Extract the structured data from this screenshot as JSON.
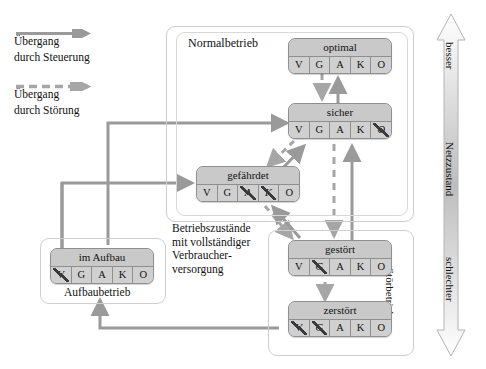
{
  "legend": {
    "items": [
      {
        "arrow": "solid-arrow-icon",
        "line1": "Übergang",
        "line2": "durch Steuerung"
      },
      {
        "arrow": "dashed-arrow-icon",
        "line1": "Übergang",
        "line2": "durch Störung"
      }
    ]
  },
  "groups": {
    "normalbetrieb": "Normalbetrieb",
    "stoerbetrieb": "Störbetrieb",
    "aufbaubetrieb": "Aufbaubetrieb"
  },
  "captions": {
    "betriebszustaende": "Betriebszustände\nmit vollständiger\nVerbraucher-\nversorgung"
  },
  "scale": {
    "top": "besser",
    "middle": "Netzzustand",
    "bottom": "schlechter"
  },
  "states": [
    {
      "id": "optimal",
      "title": "optimal",
      "cells": [
        {
          "label": "V",
          "struck": false,
          "dim": false
        },
        {
          "label": "G",
          "struck": false,
          "dim": false
        },
        {
          "label": "A",
          "struck": false,
          "dim": false
        },
        {
          "label": "K",
          "struck": false,
          "dim": false
        },
        {
          "label": "O",
          "struck": false,
          "dim": false
        }
      ]
    },
    {
      "id": "sicher",
      "title": "sicher",
      "cells": [
        {
          "label": "V",
          "struck": false,
          "dim": false
        },
        {
          "label": "G",
          "struck": false,
          "dim": false
        },
        {
          "label": "A",
          "struck": false,
          "dim": false
        },
        {
          "label": "K",
          "struck": false,
          "dim": false
        },
        {
          "label": "O",
          "struck": true,
          "dim": false
        }
      ]
    },
    {
      "id": "gefaehrdet",
      "title": "gefährdet",
      "cells": [
        {
          "label": "V",
          "struck": false,
          "dim": false
        },
        {
          "label": "G",
          "struck": false,
          "dim": false
        },
        {
          "label": "A",
          "struck": true,
          "dim": false
        },
        {
          "label": "K",
          "struck": true,
          "dim": false
        },
        {
          "label": "O",
          "struck": false,
          "dim": true
        }
      ]
    },
    {
      "id": "gestoert",
      "title": "gestört",
      "cells": [
        {
          "label": "V",
          "struck": false,
          "dim": false
        },
        {
          "label": "G",
          "struck": true,
          "dim": false
        },
        {
          "label": "A",
          "struck": false,
          "dim": true
        },
        {
          "label": "K",
          "struck": false,
          "dim": true
        },
        {
          "label": "O",
          "struck": false,
          "dim": true
        }
      ]
    },
    {
      "id": "zerstoert",
      "title": "zerstört",
      "cells": [
        {
          "label": "V",
          "struck": true,
          "dim": false
        },
        {
          "label": "G",
          "struck": true,
          "dim": false
        },
        {
          "label": "A",
          "struck": false,
          "dim": true
        },
        {
          "label": "K",
          "struck": false,
          "dim": true
        },
        {
          "label": "O",
          "struck": false,
          "dim": true
        }
      ]
    },
    {
      "id": "im-aufbau",
      "title": "im Aufbau",
      "cells": [
        {
          "label": "V",
          "struck": true,
          "dim": false
        },
        {
          "label": "G",
          "struck": false,
          "dim": false
        },
        {
          "label": "A",
          "struck": false,
          "dim": true
        },
        {
          "label": "K",
          "struck": false,
          "dim": true
        },
        {
          "label": "O",
          "struck": false,
          "dim": true
        }
      ]
    }
  ],
  "colors": {
    "line": "#8f8f8f",
    "box_fill": "#c9c9c9",
    "frame": "#cfcfcf",
    "text": "#111111"
  }
}
